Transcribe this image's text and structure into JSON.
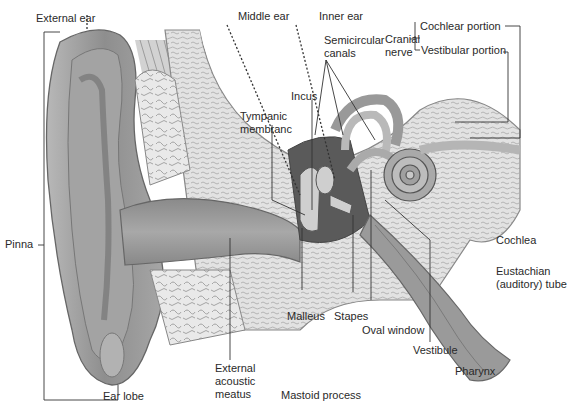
{
  "diagram": {
    "region_labels": {
      "external_ear": "External ear",
      "middle_ear": "Middle ear",
      "inner_ear": "Inner ear"
    },
    "labels": {
      "semicircular_canals": "Semicircular\ncanals",
      "cranial_nerve": "Cranial\nnerve",
      "cochlear_portion": "Cochlear portion",
      "vestibular_portion": "Vestibular portion",
      "incus": "Incus",
      "tympanic_membrane": "Tympanic\nmembranc",
      "pinna": "Pinna",
      "cochlea": "Cochlea",
      "eustachian_tube": "Eustachian\n(auditory) tube",
      "malleus": "Malleus",
      "stapes": "Stapes",
      "oval_window": "Oval window",
      "vestibule": "Vestibule",
      "pharynx": "Pharynx",
      "ear_lobe": "Ear lobe",
      "external_acoustic_meatus": "External\nacoustic\nmeatus",
      "mastoid_process": "Mastoid process"
    },
    "colors": {
      "skin": "#9a9a9a",
      "bone": "#d8d8d8",
      "dark_cavity": "#555555",
      "leader_line": "#333333"
    }
  }
}
